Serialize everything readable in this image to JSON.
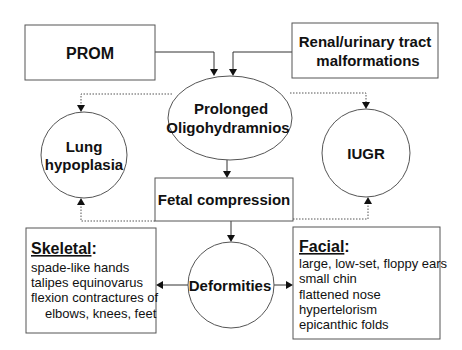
{
  "diagram": {
    "nodes": {
      "prom": {
        "label": "PROM",
        "shape": "rectangle"
      },
      "renal": {
        "line1": "Renal/urinary tract",
        "line2": "malformations",
        "shape": "rectangle"
      },
      "oligo": {
        "line1": "Prolonged",
        "line2": "Oligohydramnios",
        "shape": "ellipse"
      },
      "lung": {
        "line1": "Lung",
        "line2": "hypoplasia",
        "shape": "circle"
      },
      "iugr": {
        "label": "IUGR",
        "shape": "circle"
      },
      "fetal": {
        "label": "Fetal compression",
        "shape": "rectangle"
      },
      "deformities": {
        "label": "Deformities",
        "shape": "circle"
      },
      "skeletal": {
        "heading": "Skeletal",
        "colon": ":",
        "items": [
          "spade-like hands",
          "talipes equinovarus",
          "flexion contractures of",
          "elbows, knees, feet"
        ],
        "shape": "rectangle"
      },
      "facial": {
        "heading": "Facial",
        "colon": ":",
        "items": [
          "large, low-set, floppy ears",
          "small chin",
          "flattened nose",
          "hypertelorism",
          "epicanthic folds"
        ],
        "shape": "rectangle"
      }
    },
    "edges": [
      {
        "from": "PROM",
        "to": "Prolonged Oligohydramnios",
        "style": "solid"
      },
      {
        "from": "Renal/urinary tract malformations",
        "to": "Prolonged Oligohydramnios",
        "style": "solid"
      },
      {
        "from": "Prolonged Oligohydramnios",
        "to": "Lung hypoplasia",
        "style": "dotted"
      },
      {
        "from": "Prolonged Oligohydramnios",
        "to": "IUGR",
        "style": "dotted"
      },
      {
        "from": "Prolonged Oligohydramnios",
        "to": "Fetal compression",
        "style": "solid"
      },
      {
        "from": "Fetal compression",
        "to": "Lung hypoplasia",
        "style": "dotted"
      },
      {
        "from": "Fetal compression",
        "to": "IUGR",
        "style": "dotted"
      },
      {
        "from": "Fetal compression",
        "to": "Deformities",
        "style": "solid"
      },
      {
        "from": "Deformities",
        "to": "Skeletal",
        "style": "solid"
      },
      {
        "from": "Deformities",
        "to": "Facial",
        "style": "solid"
      }
    ],
    "colors": {
      "stroke": "#555555",
      "text": "#111111",
      "background": "#ffffff"
    }
  }
}
